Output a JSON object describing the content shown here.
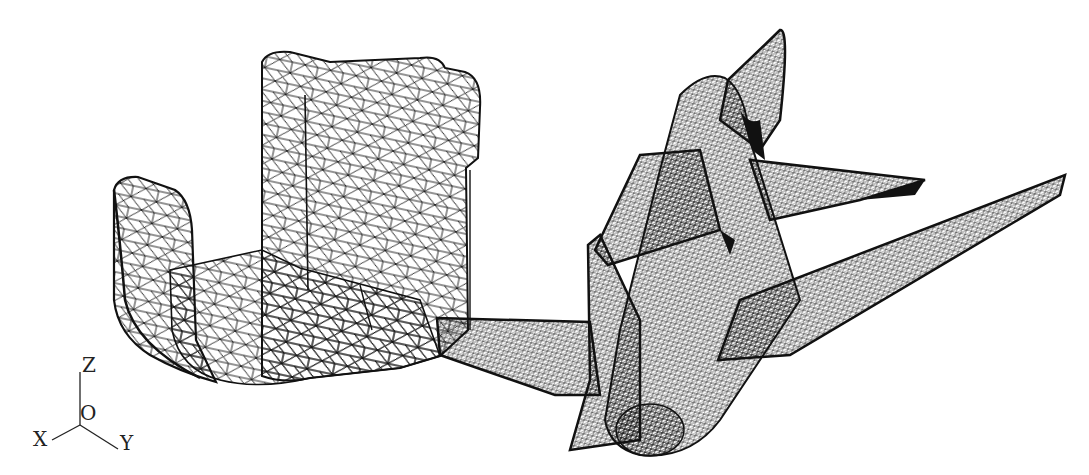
{
  "figure": {
    "background": "#ffffff",
    "ink": "#111111",
    "left_model": {
      "description": "Triangulated surface mesh of a mechanical part (U-shaped bracket)",
      "style": "coarse wireframe"
    },
    "right_model": {
      "description": "Triangulated surface mesh of an airplane",
      "style": "dense wireframe"
    },
    "axes": {
      "z": "Z",
      "origin": "O",
      "x": "X",
      "y": "Y"
    }
  }
}
